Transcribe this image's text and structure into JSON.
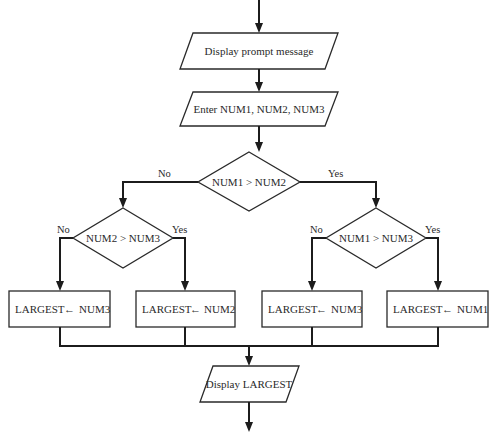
{
  "diagram": {
    "type": "flowchart",
    "nodes": {
      "prompt": {
        "shape": "parallelogram",
        "text": "Display prompt message"
      },
      "input": {
        "shape": "parallelogram",
        "text": "Enter NUM1, NUM2, NUM3"
      },
      "decision_main": {
        "shape": "diamond",
        "text": "NUM1 > NUM2",
        "no_label": "No",
        "yes_label": "Yes"
      },
      "decision_left": {
        "shape": "diamond",
        "text": "NUM2 > NUM3",
        "no_label": "No",
        "yes_label": "Yes"
      },
      "decision_right": {
        "shape": "diamond",
        "text": "NUM1 > NUM3",
        "no_label": "No",
        "yes_label": "Yes"
      },
      "assign_1": {
        "shape": "rectangle",
        "target": "LARGEST",
        "arrow": "←",
        "source": "NUM3"
      },
      "assign_2": {
        "shape": "rectangle",
        "target": "LARGEST",
        "arrow": "←",
        "source": "NUM2"
      },
      "assign_3": {
        "shape": "rectangle",
        "target": "LARGEST",
        "arrow": "←",
        "source": "NUM3"
      },
      "assign_4": {
        "shape": "rectangle",
        "target": "LARGEST",
        "arrow": "←",
        "source": "NUM1"
      },
      "output": {
        "shape": "parallelogram",
        "text": "Display LARGEST"
      }
    },
    "edges": [
      {
        "from": "start",
        "to": "prompt"
      },
      {
        "from": "prompt",
        "to": "input"
      },
      {
        "from": "input",
        "to": "decision_main"
      },
      {
        "from": "decision_main",
        "to": "decision_left",
        "label": "No"
      },
      {
        "from": "decision_main",
        "to": "decision_right",
        "label": "Yes"
      },
      {
        "from": "decision_left",
        "to": "assign_1",
        "label": "No"
      },
      {
        "from": "decision_left",
        "to": "assign_2",
        "label": "Yes"
      },
      {
        "from": "decision_right",
        "to": "assign_3",
        "label": "No"
      },
      {
        "from": "decision_right",
        "to": "assign_4",
        "label": "Yes"
      },
      {
        "from": "assign_1",
        "to": "output"
      },
      {
        "from": "assign_2",
        "to": "output"
      },
      {
        "from": "assign_3",
        "to": "output"
      },
      {
        "from": "assign_4",
        "to": "output"
      },
      {
        "from": "output",
        "to": "end"
      }
    ],
    "colors": {
      "stroke": "#1c1c1c",
      "fill": "#ffffff",
      "text": "#2a2a2a"
    }
  }
}
